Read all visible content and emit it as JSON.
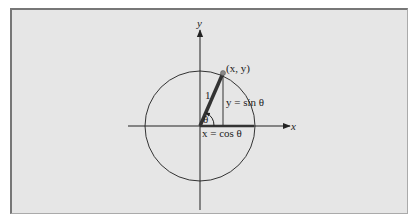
{
  "diagram": {
    "labels": {
      "y_axis": "y",
      "x_axis": "x",
      "point": "(x, y)",
      "radius": "1",
      "angle": "θ",
      "vertical_leg": "y = sin θ",
      "horizontal_leg": "x = cos θ"
    },
    "geometry": {
      "center": [
        200,
        126
      ],
      "radius": 55,
      "point": [
        223,
        73
      ],
      "x_axis_range": [
        128,
        290
      ],
      "y_axis_range": [
        20,
        210
      ]
    },
    "colors": {
      "background": "#e6e6e6",
      "stroke": "#222222",
      "radius_line": "#333333",
      "point_fill": "#888888"
    }
  }
}
